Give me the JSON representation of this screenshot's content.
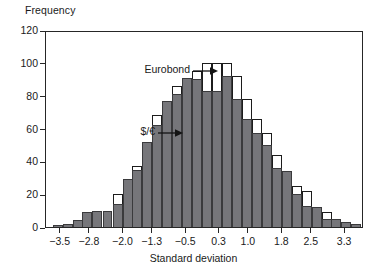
{
  "chart_data": {
    "type": "bar",
    "title": "",
    "xlabel": "Standard deviation",
    "ylabel": "Frequency",
    "ylim": [
      0,
      120
    ],
    "yticks": [
      0,
      20,
      40,
      60,
      80,
      100,
      120
    ],
    "xlim": [
      -3.85,
      3.75
    ],
    "xticks": [
      -3.5,
      -2.8,
      -2.0,
      -1.3,
      -0.5,
      0.3,
      1.0,
      1.8,
      2.5,
      3.3
    ],
    "xticklabels": [
      "−3.5",
      "−2.8",
      "−2.0",
      "−1.3",
      "−0.5",
      "0.3",
      "1.0",
      "1.8",
      "2.5",
      "3.3"
    ],
    "grid": false,
    "legend_position": "inline-annotations",
    "bin_width": 0.238,
    "bin_centers": [
      -3.57,
      -3.33,
      -3.09,
      -2.86,
      -2.62,
      -2.38,
      -2.14,
      -1.9,
      -1.67,
      -1.43,
      -1.19,
      -0.95,
      -0.71,
      -0.48,
      -0.24,
      0.0,
      0.24,
      0.48,
      0.71,
      0.95,
      1.19,
      1.43,
      1.67,
      1.9,
      2.14,
      2.38,
      2.62,
      2.86,
      3.09,
      3.33,
      3.57
    ],
    "series": [
      {
        "name": "Eurobond",
        "style": "white-outlined-bars",
        "color": "#ffffff",
        "edge_color": "#1c1c1c",
        "values": [
          1,
          2,
          4,
          9,
          10,
          10,
          20,
          29,
          37,
          52,
          68,
          77,
          86,
          91,
          95,
          100,
          100,
          100,
          92,
          78,
          66,
          57,
          44,
          34,
          25,
          22,
          12,
          9,
          5,
          3,
          2
        ]
      },
      {
        "name": "$/€",
        "style": "solid-grey-bars",
        "color": "#76767a",
        "edge_color": "#3a3a3c",
        "values": [
          1,
          2,
          4,
          9,
          10,
          10,
          14,
          29,
          35,
          52,
          62,
          77,
          81,
          91,
          90,
          83,
          83,
          92,
          78,
          66,
          57,
          50,
          36,
          34,
          20,
          13,
          12,
          5,
          5,
          3,
          2
        ]
      }
    ],
    "annotations": [
      {
        "label": "Eurobond",
        "arrow": "right",
        "points_to": "tallest white bars near 0.3"
      },
      {
        "label": "$/€",
        "arrow": "right",
        "points_to": "grey bars on left shoulder"
      }
    ]
  }
}
